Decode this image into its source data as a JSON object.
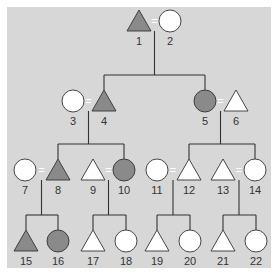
{
  "colors": {
    "background": "#d7d7d7",
    "affected": "#8a8a8a",
    "unaffected": "#ffffff",
    "outline": "#333333"
  },
  "legend": {
    "triangle": "male",
    "circle": "female",
    "shaded": "affected",
    "unshaded": "unaffected",
    "equals": "mating"
  },
  "individuals": [
    {
      "id": "1",
      "shape": "triangle",
      "affected": true,
      "x": 139,
      "y": 21
    },
    {
      "id": "2",
      "shape": "circle",
      "affected": false,
      "x": 170,
      "y": 21
    },
    {
      "id": "3",
      "shape": "circle",
      "affected": false,
      "x": 73,
      "y": 101
    },
    {
      "id": "4",
      "shape": "triangle",
      "affected": true,
      "x": 104,
      "y": 101
    },
    {
      "id": "5",
      "shape": "circle",
      "affected": true,
      "x": 205,
      "y": 101
    },
    {
      "id": "6",
      "shape": "triangle",
      "affected": false,
      "x": 236,
      "y": 101
    },
    {
      "id": "7",
      "shape": "circle",
      "affected": false,
      "x": 25,
      "y": 170
    },
    {
      "id": "8",
      "shape": "triangle",
      "affected": true,
      "x": 58,
      "y": 170
    },
    {
      "id": "9",
      "shape": "triangle",
      "affected": false,
      "x": 93,
      "y": 170
    },
    {
      "id": "10",
      "shape": "circle",
      "affected": true,
      "x": 124,
      "y": 170
    },
    {
      "id": "11",
      "shape": "circle",
      "affected": false,
      "x": 157,
      "y": 170
    },
    {
      "id": "12",
      "shape": "triangle",
      "affected": false,
      "x": 189,
      "y": 170
    },
    {
      "id": "13",
      "shape": "triangle",
      "affected": false,
      "x": 223,
      "y": 170
    },
    {
      "id": "14",
      "shape": "circle",
      "affected": false,
      "x": 255,
      "y": 170
    },
    {
      "id": "15",
      "shape": "triangle",
      "affected": true,
      "x": 26,
      "y": 241
    },
    {
      "id": "16",
      "shape": "circle",
      "affected": true,
      "x": 58,
      "y": 241
    },
    {
      "id": "17",
      "shape": "triangle",
      "affected": false,
      "x": 93,
      "y": 241
    },
    {
      "id": "18",
      "shape": "circle",
      "affected": false,
      "x": 126,
      "y": 241
    },
    {
      "id": "19",
      "shape": "triangle",
      "affected": false,
      "x": 157,
      "y": 241
    },
    {
      "id": "20",
      "shape": "circle",
      "affected": false,
      "x": 190,
      "y": 241
    },
    {
      "id": "21",
      "shape": "triangle",
      "affected": false,
      "x": 223,
      "y": 241
    },
    {
      "id": "22",
      "shape": "circle",
      "affected": false,
      "x": 256,
      "y": 241
    }
  ],
  "matings": [
    {
      "partners": [
        "1",
        "2"
      ],
      "children": [
        "4",
        "5"
      ]
    },
    {
      "partners": [
        "3",
        "4"
      ],
      "children": [
        "8",
        "10"
      ]
    },
    {
      "partners": [
        "5",
        "6"
      ],
      "children": [
        "12",
        "14"
      ]
    },
    {
      "partners": [
        "7",
        "8"
      ],
      "children": [
        "15",
        "16"
      ]
    },
    {
      "partners": [
        "9",
        "10"
      ],
      "children": [
        "17",
        "18"
      ]
    },
    {
      "partners": [
        "11",
        "12"
      ],
      "children": [
        "19",
        "20"
      ]
    },
    {
      "partners": [
        "13",
        "14"
      ],
      "children": [
        "21",
        "22"
      ]
    }
  ],
  "mating_symbol": "="
}
